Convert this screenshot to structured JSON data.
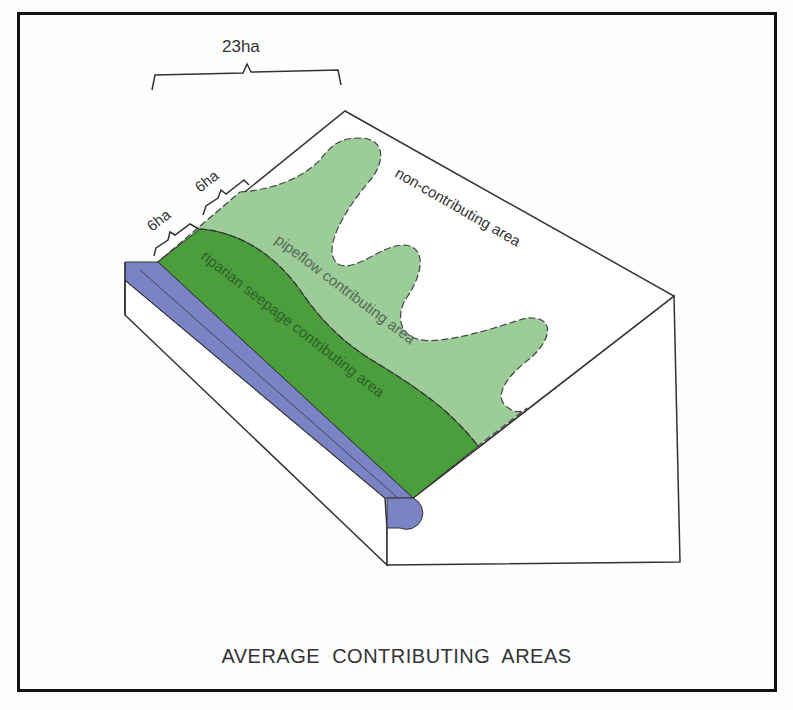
{
  "figure": {
    "caption": "AVERAGE CONTRIBUTING AREAS",
    "dimensions": {
      "total": "23ha",
      "riparian": "6ha",
      "pipeflow": "6ha"
    },
    "labels": {
      "non_contributing": "non-contributing area",
      "pipeflow": "pipeflow contributing area",
      "riparian": "riparian seepage contributing area"
    },
    "colors": {
      "stream": "#7a84c4",
      "riparian": "#4a9e3c",
      "pipeflow": "#9ccc98",
      "non_contributing": "#ffffff",
      "outline": "#333333"
    }
  }
}
